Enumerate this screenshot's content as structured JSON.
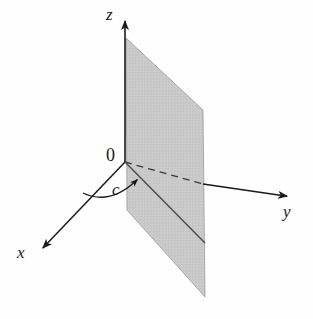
{
  "figure": {
    "kind": "3d-coordinate-axes-with-plane",
    "background_color": "#fefefe"
  },
  "labels": {
    "z_axis": "z",
    "y_axis": "y",
    "x_axis": "x",
    "origin": "0",
    "distance": "c"
  },
  "colors": {
    "axis_stroke": "#1a1a1a",
    "plane_fill": "#c8c8c8",
    "plane_edge": "#8c8c8c",
    "trace_line": "#4a4a4a",
    "dashed_axis": "#3a3a3a",
    "label_text": "#1a1a1a"
  },
  "geometry": {
    "origin": {
      "x": 125,
      "y": 162
    },
    "z_axis_tip": {
      "x": 125,
      "y": 14
    },
    "y_axis_tip": {
      "x": 293,
      "y": 197
    },
    "x_axis_tip": {
      "x": 38,
      "y": 253
    },
    "plane_corners": [
      {
        "x": 126,
        "y": 38
      },
      {
        "x": 203,
        "y": 110
      },
      {
        "x": 205,
        "y": 297
      },
      {
        "x": 127,
        "y": 210
      }
    ],
    "plane_trace_start": {
      "x": 125,
      "y": 162
    },
    "plane_trace_end": {
      "x": 205,
      "y": 243
    },
    "dashed_segment_start": {
      "x": 125,
      "y": 162
    },
    "dashed_segment_end": {
      "x": 203,
      "y": 184
    },
    "arc_arrow_tip": {
      "x": 141,
      "y": 176
    },
    "arc_start": {
      "x": 83,
      "y": 193
    }
  },
  "chart_data": {
    "type": "scatter",
    "title": "",
    "xlabel": "x",
    "ylabel": "y",
    "zlabel": "z",
    "annotations": [
      {
        "text": "0",
        "meaning": "origin of coordinate system"
      },
      {
        "text": "c",
        "meaning": "signed distance from origin along x-axis to the plane"
      },
      {
        "text": "x",
        "meaning": "x-axis, drawn toward lower-left (toward viewer)"
      },
      {
        "text": "y",
        "meaning": "y-axis, drawn toward lower-right"
      },
      {
        "text": "z",
        "meaning": "z-axis, drawn vertically upward"
      }
    ],
    "shapes": [
      {
        "name": "plane-x-equals-c",
        "kind": "parallelogram",
        "fill": "#c8c8c8",
        "meaning": "the vertical plane x = c, parallel to the yz-plane"
      },
      {
        "name": "trace-line",
        "kind": "line",
        "meaning": "intersection of the plane x = c with the xy-plane"
      },
      {
        "name": "distance-arc",
        "kind": "arc-with-arrow",
        "meaning": "curved arrow from the x-axis indicating the distance c"
      }
    ],
    "grid": false,
    "legend": null
  }
}
